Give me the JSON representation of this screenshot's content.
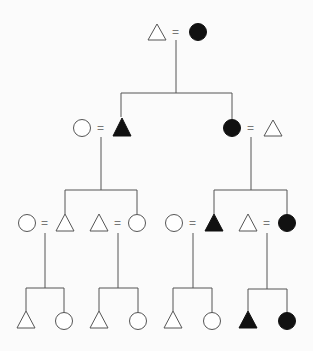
{
  "diagram": {
    "type": "kinship-chart",
    "legend_implied": {
      "triangle": "male",
      "circle": "female",
      "equals": "marriage",
      "filled": "highlighted lineage member",
      "open": "non-lineage member"
    },
    "marriage_symbol": "=",
    "generations": [
      {
        "level": 1,
        "couples": [
          {
            "id": "g1",
            "left": {
              "shape": "triangle",
              "filled": false
            },
            "right": {
              "shape": "circle",
              "filled": true
            }
          }
        ]
      },
      {
        "level": 2,
        "couples": [
          {
            "id": "g2a",
            "parent": "g1",
            "left": {
              "shape": "circle",
              "filled": false
            },
            "right": {
              "shape": "triangle",
              "filled": true
            }
          },
          {
            "id": "g2b",
            "parent": "g1",
            "left": {
              "shape": "circle",
              "filled": true
            },
            "right": {
              "shape": "triangle",
              "filled": false
            }
          }
        ]
      },
      {
        "level": 3,
        "couples": [
          {
            "id": "g3a",
            "parent": "g2a",
            "left": {
              "shape": "circle",
              "filled": false
            },
            "right": {
              "shape": "triangle",
              "filled": false
            }
          },
          {
            "id": "g3b",
            "parent": "g2a",
            "left": {
              "shape": "triangle",
              "filled": false
            },
            "right": {
              "shape": "circle",
              "filled": false
            }
          },
          {
            "id": "g3c",
            "parent": "g2b",
            "left": {
              "shape": "circle",
              "filled": false
            },
            "right": {
              "shape": "triangle",
              "filled": true
            }
          },
          {
            "id": "g3d",
            "parent": "g2b",
            "left": {
              "shape": "triangle",
              "filled": false
            },
            "right": {
              "shape": "circle",
              "filled": true
            }
          }
        ]
      },
      {
        "level": 4,
        "sibling_groups": [
          {
            "parent": "g3a",
            "children": [
              {
                "shape": "triangle",
                "filled": false
              },
              {
                "shape": "circle",
                "filled": false
              }
            ]
          },
          {
            "parent": "g3b",
            "children": [
              {
                "shape": "triangle",
                "filled": false
              },
              {
                "shape": "circle",
                "filled": false
              }
            ]
          },
          {
            "parent": "g3c",
            "children": [
              {
                "shape": "triangle",
                "filled": false
              },
              {
                "shape": "circle",
                "filled": false
              }
            ]
          },
          {
            "parent": "g3d",
            "children": [
              {
                "shape": "triangle",
                "filled": true
              },
              {
                "shape": "circle",
                "filled": true
              }
            ]
          }
        ]
      }
    ]
  },
  "colors": {
    "background": "#fbfbfb",
    "line": "#555555",
    "filled": "#111111",
    "open_fill": "#ffffff"
  }
}
